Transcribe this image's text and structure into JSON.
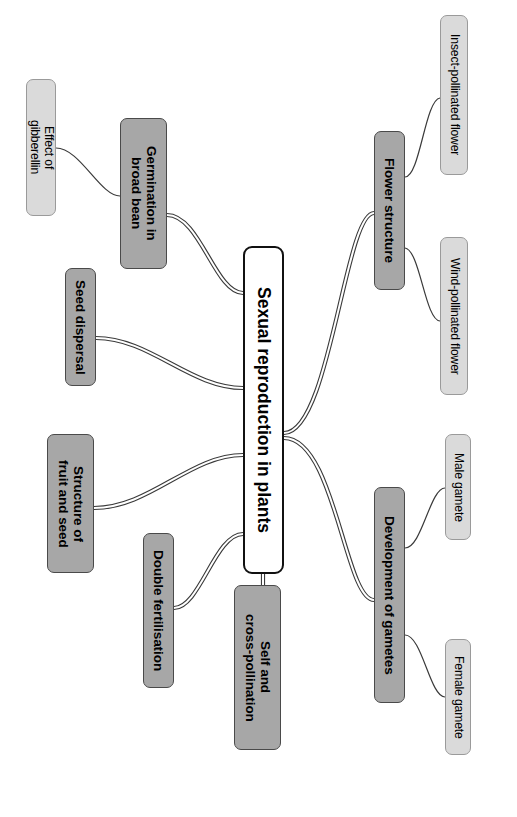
{
  "diagram": {
    "title": "Sexual reproduction in plants",
    "type": "mind-map",
    "orientation": "rotated-90-clockwise",
    "colors": {
      "background": "#ffffff",
      "central_fill": "#ffffff",
      "central_border": "#111111",
      "main_fill": "#a7a7a7",
      "main_border": "#4a4a4a",
      "leaf_fill": "#dadada",
      "leaf_border": "#9a9a9a",
      "edge": "#3a3a3a"
    }
  },
  "central": {
    "label": "Sexual reproduction in plants"
  },
  "branches": [
    {
      "id": "germination-in-broad-bean",
      "label": "Germination in\nbroad bean",
      "children": [
        {
          "id": "effect-of-gibberellin",
          "label": "Effect of\ngibberellin"
        }
      ]
    },
    {
      "id": "seed-dispersal",
      "label": "Seed dispersal",
      "children": []
    },
    {
      "id": "structure-of-fruit-and-seed",
      "label": "Structure of\nfruit and seed",
      "children": []
    },
    {
      "id": "double-fertilisation",
      "label": "Double fertilisation",
      "children": []
    },
    {
      "id": "self-and-cross-pollination",
      "label": "Self and\ncross-pollination",
      "children": []
    },
    {
      "id": "flower-structure",
      "label": "Flower structure",
      "children": [
        {
          "id": "insect-pollinated-flower",
          "label": "Insect-pollinated flower"
        },
        {
          "id": "wind-pollinated-flower",
          "label": "Wind-pollinated flower"
        }
      ]
    },
    {
      "id": "development-of-gametes",
      "label": "Development of gametes",
      "children": [
        {
          "id": "male-gamete",
          "label": "Male gamete"
        },
        {
          "id": "female-gamete",
          "label": "Female gamete"
        }
      ]
    }
  ],
  "layout": {
    "nodes": {
      "central": {
        "x": 243,
        "y": 246,
        "w": 41,
        "h": 328
      },
      "germination-in-broad-bean": {
        "x": 120,
        "y": 118,
        "w": 47,
        "h": 151
      },
      "effect-of-gibberellin": {
        "x": 26,
        "y": 79,
        "w": 30,
        "h": 137
      },
      "seed-dispersal": {
        "x": 65,
        "y": 268,
        "w": 31,
        "h": 118
      },
      "structure-of-fruit-and-seed": {
        "x": 47,
        "y": 434,
        "w": 47,
        "h": 139
      },
      "double-fertilisation": {
        "x": 143,
        "y": 533,
        "w": 31,
        "h": 155
      },
      "self-and-cross-pollination": {
        "x": 234,
        "y": 585,
        "w": 47,
        "h": 165
      },
      "flower-structure": {
        "x": 374,
        "y": 131,
        "w": 31,
        "h": 159
      },
      "insect-pollinated-flower": {
        "x": 440,
        "y": 15,
        "w": 28,
        "h": 160
      },
      "wind-pollinated-flower": {
        "x": 440,
        "y": 237,
        "w": 28,
        "h": 158
      },
      "development-of-gametes": {
        "x": 374,
        "y": 487,
        "w": 31,
        "h": 216
      },
      "male-gamete": {
        "x": 445,
        "y": 434,
        "w": 26,
        "h": 106
      },
      "female-gamete": {
        "x": 445,
        "y": 639,
        "w": 26,
        "h": 116
      }
    },
    "edges": [
      {
        "from": "central",
        "to": "germination-in-broad-bean",
        "d": "M 243,293 C 215,293 200,215 167,215",
        "double": true
      },
      {
        "from": "germination-in-broad-bean",
        "to": "effect-of-gibberellin",
        "d": "M 120,196 C 100,196 80,148 56,148",
        "double": false
      },
      {
        "from": "central",
        "to": "seed-dispersal",
        "d": "M 243,388 C 190,388 150,338 96,338",
        "double": true
      },
      {
        "from": "central",
        "to": "structure-of-fruit-and-seed",
        "d": "M 243,455 C 190,455 150,508 94,508",
        "double": true
      },
      {
        "from": "central",
        "to": "double-fertilisation",
        "d": "M 243,534 C 215,534 200,608 174,608",
        "double": true
      },
      {
        "from": "central",
        "to": "self-and-cross-pollination",
        "d": "M 263,574 L 263,585",
        "double": true
      },
      {
        "from": "central",
        "to": "flower-structure",
        "d": "M 284,433 C 330,433 345,213 374,213",
        "double": true
      },
      {
        "from": "flower-structure",
        "to": "insect-pollinated-flower",
        "d": "M 405,177 C 420,177 425,100 440,98",
        "double": false
      },
      {
        "from": "flower-structure",
        "to": "wind-pollinated-flower",
        "d": "M 405,248 C 420,250 425,320 440,321",
        "double": false
      },
      {
        "from": "central",
        "to": "development-of-gametes",
        "d": "M 284,438 C 335,438 345,600 374,600",
        "double": true
      },
      {
        "from": "development-of-gametes",
        "to": "male-gamete",
        "d": "M 405,548 C 422,548 430,488 445,488",
        "double": false
      },
      {
        "from": "development-of-gametes",
        "to": "female-gamete",
        "d": "M 405,635 C 422,635 430,697 445,697",
        "double": false
      }
    ]
  }
}
